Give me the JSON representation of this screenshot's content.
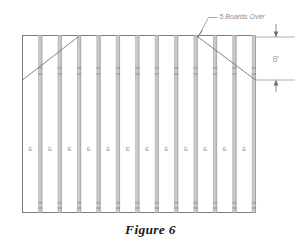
{
  "figure": {
    "caption": "Figure 6",
    "annotation": {
      "label": "5 Boards Over",
      "leader_icon": "leader-line-icon"
    },
    "dimension": {
      "label": "8'",
      "arrow_top_icon": "arrow-up-icon",
      "arrow_bottom_icon": "arrow-down-icon"
    },
    "boards": {
      "count": 12,
      "letter": "E",
      "letters": [
        "E",
        "E",
        "E",
        "E",
        "E",
        "E",
        "E",
        "E",
        "E",
        "E",
        "E",
        "E"
      ]
    },
    "colors": {
      "outline": "#7a7a7a",
      "board_edge": "#b4b4b4",
      "batten_fill": "#c9c9c9",
      "diagonal": "#6f6f6f",
      "annotation_text": "#8d8d8d",
      "dimension_text": "#9d9d9d",
      "letter_text": "#9a9a9a",
      "caption_text": "#1a1a1a",
      "background": "#ffffff"
    }
  }
}
